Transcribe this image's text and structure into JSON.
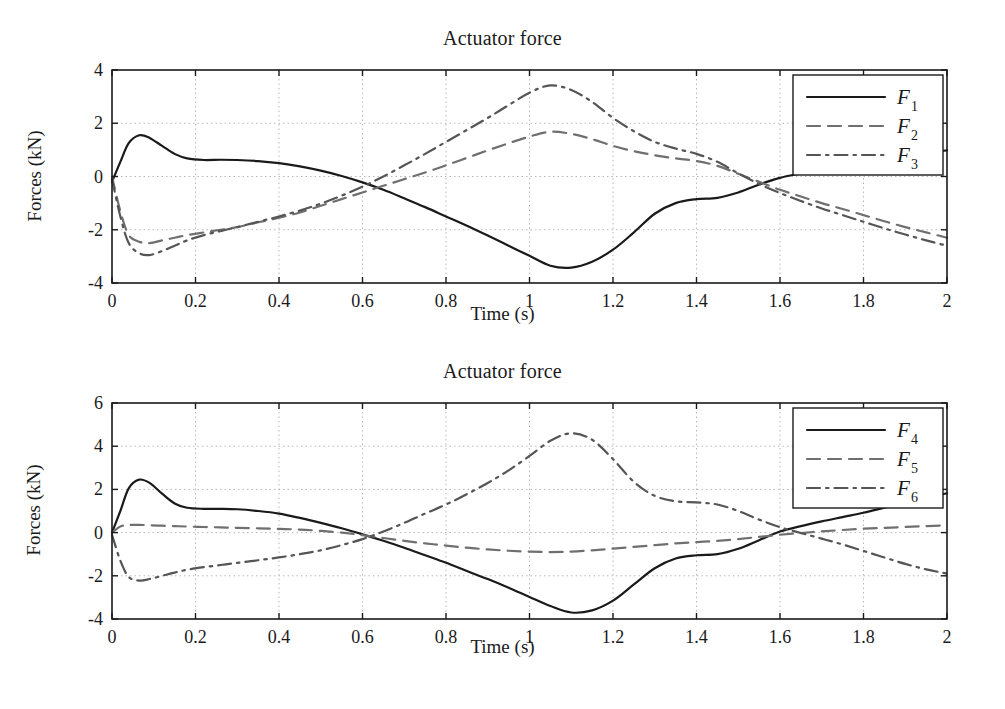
{
  "figure": {
    "width": 1005,
    "height": 709,
    "background": "#ffffff",
    "ink_color": "#1a1a1a",
    "grid_color": "#b8b8b8"
  },
  "panels": [
    {
      "id": "top",
      "title": "Actuator force",
      "xlabel": "Time (s)",
      "ylabel": "Forces (kN)",
      "xticks": [
        "0",
        "0.2",
        "0.4",
        "0.6",
        "0.8",
        "1",
        "1.2",
        "1.4",
        "1.6",
        "1.8",
        "2"
      ],
      "yticks": [
        "4",
        "2",
        "0",
        "-2",
        "-4"
      ],
      "legend": [
        {
          "name": "F1",
          "label": "F",
          "sub": "1",
          "style": "solid"
        },
        {
          "name": "F2",
          "label": "F",
          "sub": "2",
          "style": "dashed"
        },
        {
          "name": "F3",
          "label": "F",
          "sub": "3",
          "style": "dashdot"
        }
      ]
    },
    {
      "id": "bottom",
      "title": "Actuator force",
      "xlabel": "Time (s)",
      "ylabel": "Forces (kN)",
      "xticks": [
        "0",
        "0.2",
        "0.4",
        "0.6",
        "0.8",
        "1",
        "1.2",
        "1.4",
        "1.6",
        "1.8",
        "2"
      ],
      "yticks": [
        "6",
        "4",
        "2",
        "0",
        "-2",
        "-4"
      ],
      "legend": [
        {
          "name": "F4",
          "label": "F",
          "sub": "4",
          "style": "solid"
        },
        {
          "name": "F5",
          "label": "F",
          "sub": "5",
          "style": "dashed"
        },
        {
          "name": "F6",
          "label": "F",
          "sub": "6",
          "style": "dashdot"
        }
      ]
    }
  ],
  "chart_data": [
    {
      "type": "line",
      "title": "Actuator force",
      "xlabel": "Time (s)",
      "ylabel": "Forces (kN)",
      "xlim": [
        0,
        2
      ],
      "ylim": [
        -4,
        4
      ],
      "xticks": [
        0,
        0.2,
        0.4,
        0.6,
        0.8,
        1,
        1.2,
        1.4,
        1.6,
        1.8,
        2
      ],
      "yticks": [
        -4,
        -2,
        0,
        2,
        4
      ],
      "grid": true,
      "legend_position": "upper right",
      "x": [
        0,
        0.02,
        0.04,
        0.065,
        0.09,
        0.12,
        0.15,
        0.18,
        0.22,
        0.26,
        0.3,
        0.35,
        0.4,
        0.45,
        0.5,
        0.55,
        0.6,
        0.65,
        0.7,
        0.75,
        0.8,
        0.85,
        0.9,
        0.95,
        1.0,
        1.05,
        1.1,
        1.15,
        1.2,
        1.25,
        1.3,
        1.35,
        1.4,
        1.45,
        1.5,
        1.55,
        1.6,
        1.65,
        1.7,
        1.75,
        1.8,
        1.85,
        1.9,
        1.95,
        2.0
      ],
      "series": [
        {
          "name": "F1",
          "style": "solid",
          "values": [
            -0.2,
            0.55,
            1.25,
            1.55,
            1.45,
            1.15,
            0.85,
            0.68,
            0.62,
            0.63,
            0.62,
            0.58,
            0.5,
            0.38,
            0.22,
            0.02,
            -0.22,
            -0.5,
            -0.82,
            -1.15,
            -1.5,
            -1.85,
            -2.22,
            -2.6,
            -2.98,
            -3.35,
            -3.42,
            -3.2,
            -2.75,
            -2.1,
            -1.4,
            -1.0,
            -0.85,
            -0.8,
            -0.6,
            -0.3,
            -0.05,
            0.12,
            0.28,
            0.42,
            0.55,
            0.68,
            0.8,
            0.9,
            0.98
          ]
        },
        {
          "name": "F2",
          "style": "dashed",
          "values": [
            0.0,
            -1.3,
            -2.2,
            -2.45,
            -2.5,
            -2.4,
            -2.3,
            -2.2,
            -2.1,
            -2.0,
            -1.9,
            -1.72,
            -1.55,
            -1.35,
            -1.1,
            -0.85,
            -0.6,
            -0.35,
            -0.1,
            0.15,
            0.42,
            0.7,
            0.98,
            1.25,
            1.5,
            1.68,
            1.6,
            1.4,
            1.15,
            0.95,
            0.8,
            0.68,
            0.58,
            0.4,
            0.1,
            -0.2,
            -0.5,
            -0.75,
            -1.0,
            -1.22,
            -1.45,
            -1.68,
            -1.9,
            -2.1,
            -2.3
          ]
        },
        {
          "name": "F3",
          "style": "dashdot",
          "values": [
            -0.1,
            -1.5,
            -2.5,
            -2.88,
            -2.95,
            -2.8,
            -2.6,
            -2.4,
            -2.2,
            -2.05,
            -1.9,
            -1.7,
            -1.5,
            -1.28,
            -1.02,
            -0.72,
            -0.38,
            0.0,
            0.42,
            0.85,
            1.3,
            1.75,
            2.2,
            2.68,
            3.15,
            3.42,
            3.25,
            2.8,
            2.2,
            1.7,
            1.3,
            1.05,
            0.85,
            0.55,
            0.12,
            -0.28,
            -0.62,
            -0.92,
            -1.2,
            -1.45,
            -1.7,
            -1.95,
            -2.18,
            -2.4,
            -2.6
          ]
        }
      ]
    },
    {
      "type": "line",
      "title": "Actuator force",
      "xlabel": "Time (s)",
      "ylabel": "Forces (kN)",
      "xlim": [
        0,
        2
      ],
      "ylim": [
        -4,
        6
      ],
      "xticks": [
        0,
        0.2,
        0.4,
        0.6,
        0.8,
        1,
        1.2,
        1.4,
        1.6,
        1.8,
        2
      ],
      "yticks": [
        -4,
        -2,
        0,
        2,
        4,
        6
      ],
      "grid": true,
      "legend_position": "upper right",
      "x": [
        0,
        0.02,
        0.04,
        0.065,
        0.09,
        0.12,
        0.15,
        0.18,
        0.22,
        0.26,
        0.3,
        0.35,
        0.4,
        0.45,
        0.5,
        0.55,
        0.6,
        0.65,
        0.7,
        0.75,
        0.8,
        0.85,
        0.9,
        0.95,
        1.0,
        1.05,
        1.1,
        1.15,
        1.2,
        1.25,
        1.3,
        1.35,
        1.4,
        1.45,
        1.5,
        1.55,
        1.6,
        1.65,
        1.7,
        1.75,
        1.8,
        1.85,
        1.9,
        1.95,
        2.0
      ],
      "series": [
        {
          "name": "F4",
          "style": "solid",
          "values": [
            0.0,
            1.0,
            2.05,
            2.45,
            2.3,
            1.8,
            1.35,
            1.15,
            1.1,
            1.1,
            1.08,
            1.0,
            0.88,
            0.68,
            0.45,
            0.2,
            -0.08,
            -0.38,
            -0.7,
            -1.05,
            -1.4,
            -1.78,
            -2.15,
            -2.55,
            -2.98,
            -3.4,
            -3.7,
            -3.6,
            -3.15,
            -2.4,
            -1.65,
            -1.2,
            -1.05,
            -1.0,
            -0.75,
            -0.35,
            0.05,
            0.3,
            0.52,
            0.72,
            0.92,
            1.15,
            1.38,
            1.6,
            1.82
          ]
        },
        {
          "name": "F5",
          "style": "dashed",
          "values": [
            0.0,
            0.28,
            0.35,
            0.36,
            0.34,
            0.32,
            0.3,
            0.28,
            0.26,
            0.24,
            0.22,
            0.2,
            0.17,
            0.14,
            0.08,
            0.0,
            -0.12,
            -0.25,
            -0.38,
            -0.5,
            -0.6,
            -0.7,
            -0.78,
            -0.84,
            -0.88,
            -0.9,
            -0.88,
            -0.82,
            -0.74,
            -0.66,
            -0.58,
            -0.5,
            -0.44,
            -0.38,
            -0.3,
            -0.2,
            -0.1,
            -0.02,
            0.06,
            0.12,
            0.18,
            0.22,
            0.26,
            0.3,
            0.34
          ]
        },
        {
          "name": "F6",
          "style": "dashdot",
          "values": [
            -0.1,
            -1.3,
            -2.05,
            -2.22,
            -2.15,
            -2.0,
            -1.85,
            -1.72,
            -1.6,
            -1.5,
            -1.4,
            -1.28,
            -1.15,
            -1.0,
            -0.82,
            -0.58,
            -0.3,
            0.05,
            0.45,
            0.88,
            1.3,
            1.78,
            2.3,
            2.88,
            3.55,
            4.25,
            4.6,
            4.3,
            3.4,
            2.35,
            1.7,
            1.45,
            1.4,
            1.3,
            1.0,
            0.6,
            0.25,
            -0.02,
            -0.28,
            -0.55,
            -0.85,
            -1.15,
            -1.45,
            -1.7,
            -1.9
          ]
        }
      ]
    }
  ]
}
